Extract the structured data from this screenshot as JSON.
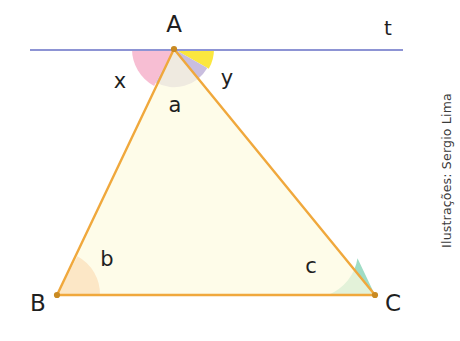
{
  "figure": {
    "type": "geometry-diagram",
    "background_color": "#ffffff",
    "vertices": [
      {
        "name": "A",
        "label": "A",
        "x": 174,
        "y": 49,
        "label_x": 174,
        "label_y": 32
      },
      {
        "name": "B",
        "label": "B",
        "x": 57,
        "y": 295,
        "label_x": 38,
        "label_y": 311
      },
      {
        "name": "C",
        "label": "C",
        "x": 375,
        "y": 295,
        "label_x": 393,
        "label_y": 311
      }
    ],
    "triangle": {
      "fill_color": "#fdfbe0",
      "stroke_color": "#f0a83c",
      "stroke_width": 2.4,
      "points": "174,49 57,295 375,295"
    },
    "line_t": {
      "label": "t",
      "color": "#8d94d4",
      "stroke_width": 2.2,
      "x1": 30,
      "y1": 50,
      "x2": 403,
      "y2": 50,
      "label_x": 388,
      "label_y": 35
    },
    "angles": [
      {
        "name": "x",
        "label": "x",
        "color": "#f7bed3",
        "vertex": "A",
        "radius": 42,
        "label_x": 120,
        "label_y": 88
      },
      {
        "name": "a",
        "label": "a",
        "color": "#c9bedf",
        "vertex": "A",
        "radius": 38,
        "label_x": 175,
        "label_y": 112
      },
      {
        "name": "y",
        "label": "y",
        "color": "#fbe73f",
        "vertex": "A",
        "radius": 40,
        "label_x": 227,
        "label_y": 85
      },
      {
        "name": "b",
        "label": "b",
        "color": "#f6b283",
        "vertex": "B",
        "radius": 43,
        "label_x": 107,
        "label_y": 266
      },
      {
        "name": "c",
        "label": "c",
        "color": "#9fdcc5",
        "vertex": "C",
        "radius": 47,
        "label_x": 311,
        "label_y": 273
      }
    ],
    "vertex_dot_color": "#c98a22",
    "credit": "Ilustrações: Sergio Lima"
  }
}
